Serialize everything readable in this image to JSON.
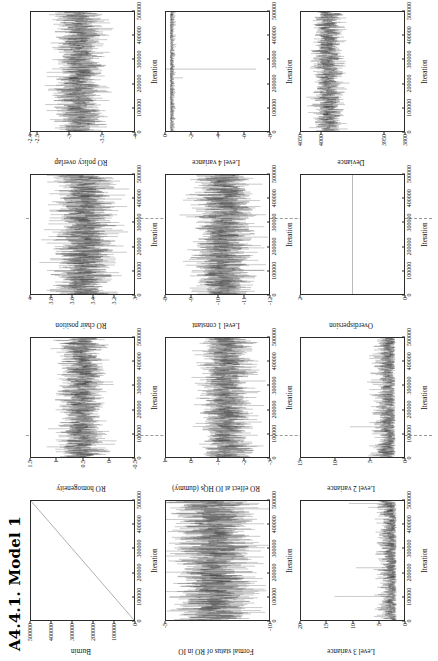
{
  "page": {
    "title": "A4.4.1. Model 1",
    "orientation": "landscape-rotated-90ccw",
    "shared_xlabel": "Iteration",
    "axis_color": "#2b2b2b",
    "trace_color": "#000000",
    "divider_color": "#9a9a9a"
  },
  "chart_data": [
    {
      "id": "burnin",
      "type": "line",
      "title": "",
      "ylabel": "Burnin",
      "xlabel": "Iteration",
      "xlim": [
        0,
        500000
      ],
      "ylim": [
        0,
        500000
      ],
      "xticks": [
        0,
        100000,
        200000,
        300000,
        400000,
        500000
      ],
      "xticklabels": [
        "0",
        "100000",
        "200000",
        "300000",
        "400000",
        "500000"
      ],
      "yticks": [
        0,
        100000,
        200000,
        300000,
        400000,
        500000
      ],
      "yticklabels": [
        "0",
        "100000",
        "200000",
        "300000",
        "400000",
        "500000"
      ],
      "grid": false,
      "note": "monotone increasing straight diagonal line from (0,0) to (500000,500000)",
      "series": [
        {
          "name": "burnin",
          "x": [
            0,
            500000
          ],
          "values": [
            0,
            500000
          ]
        }
      ]
    },
    {
      "id": "ro-homogeneity",
      "type": "line",
      "ylabel": "RO homogeneity",
      "xlabel": "Iteration",
      "xlim": [
        0,
        500000
      ],
      "ylim": [
        -0.5,
        1.5
      ],
      "xticks": [
        0,
        100000,
        200000,
        300000,
        400000,
        500000
      ],
      "xticklabels": [
        "0",
        "100000",
        "200000",
        "300000",
        "400000",
        "500000"
      ],
      "yticks": [
        -0.5,
        0,
        0.5,
        1,
        1.5
      ],
      "yticklabels": [
        "-0.5",
        "0",
        "0.5",
        "1",
        "1.5"
      ],
      "band": [
        0.08,
        0.95
      ],
      "mean": 0.5,
      "grid": false
    },
    {
      "id": "ro-chair-position",
      "type": "line",
      "ylabel": "RO chair position",
      "xlabel": "Iteration",
      "xlim": [
        0,
        500000
      ],
      "ylim": [
        3.0,
        4.0
      ],
      "xticks": [
        0,
        100000,
        200000,
        300000,
        400000,
        500000
      ],
      "xticklabels": [
        "0",
        "100000",
        "200000",
        "300000",
        "400000",
        "500000"
      ],
      "yticks": [
        3.0,
        3.2,
        3.4,
        3.6,
        3.8,
        4.0
      ],
      "yticklabels": [
        "3",
        "3.2",
        "3.4",
        "3.6",
        "3.8",
        "4"
      ],
      "band": [
        3.18,
        3.78
      ],
      "mean": 3.47,
      "grid": false
    },
    {
      "id": "ro-policy-overlap",
      "type": "line",
      "ylabel": "RO policy overlap",
      "xlabel": "Iteration",
      "xlim": [
        0,
        500000
      ],
      "ylim": [
        -4.0,
        -2.4
      ],
      "xticks": [
        0,
        100000,
        200000,
        300000,
        400000,
        500000
      ],
      "xticklabels": [
        "0",
        "100000",
        "200000",
        "300000",
        "400000",
        "500000"
      ],
      "yticks": [
        -4.0,
        -3.5,
        -3.0,
        -2.5,
        -2.4
      ],
      "yticklabels": [
        "-4",
        "-3.5",
        "-3",
        "-2.5",
        "-2.4"
      ],
      "band": [
        -3.52,
        -2.78
      ],
      "mean": -3.14,
      "grid": false
    },
    {
      "id": "formal-status-of-ro-in-io",
      "type": "line",
      "ylabel": "Formal status of RO in IO",
      "xlabel": "Iteration",
      "xlim": [
        0,
        500000
      ],
      "ylim": [
        -10,
        -5
      ],
      "xticks": [
        0,
        100000,
        200000,
        300000,
        400000,
        500000
      ],
      "xticklabels": [
        "0",
        "100000",
        "200000",
        "300000",
        "400000",
        "500000"
      ],
      "yticks": [
        -10,
        -5,
        0,
        5
      ],
      "yticklabels": [
        "-10",
        "-5",
        "0",
        "5"
      ],
      "band": [
        -9.3,
        -5.4
      ],
      "mean": -7.3,
      "grid": false
    },
    {
      "id": "ro-effect-at-io-hqs-dummy",
      "type": "line",
      "ylabel": "RO effect at IO HQs (dummy)",
      "xlabel": "Iteration",
      "xlim": [
        0,
        500000
      ],
      "ylim": [
        -3,
        1
      ],
      "xticks": [
        0,
        100000,
        200000,
        300000,
        400000,
        500000
      ],
      "xticklabels": [
        "0",
        "100000",
        "200000",
        "300000",
        "400000",
        "500000"
      ],
      "yticks": [
        -3,
        -2,
        -1,
        0,
        1
      ],
      "yticklabels": [
        "-3",
        "-2",
        "-1",
        "0",
        "1"
      ],
      "band": [
        -2.35,
        -0.35
      ],
      "mean": -1.3,
      "grid": false
    },
    {
      "id": "level-1-constant",
      "type": "line",
      "ylabel": "Level 1 constant",
      "xlabel": "Iteration",
      "xlim": [
        0,
        500000
      ],
      "ylim": [
        -12,
        -8
      ],
      "xticks": [
        0,
        100000,
        200000,
        300000,
        400000,
        500000
      ],
      "xticklabels": [
        "0",
        "100000",
        "200000",
        "300000",
        "400000",
        "500000"
      ],
      "yticks": [
        -12,
        -11,
        -10,
        -9,
        -8
      ],
      "yticklabels": [
        "-12",
        "-11",
        "-10",
        "-9",
        "-8"
      ],
      "band": [
        -11.4,
        -9.1
      ],
      "mean": -10.2,
      "grid": false
    },
    {
      "id": "level-4-variance",
      "type": "line",
      "ylabel": "Level 4 variance",
      "xlabel": "Iteration",
      "xlim": [
        0,
        500000
      ],
      "ylim": [
        -8,
        0
      ],
      "xticks": [
        0,
        100000,
        200000,
        300000,
        400000,
        500000
      ],
      "xticklabels": [
        "0",
        "100000",
        "200000",
        "300000",
        "400000",
        "500000"
      ],
      "yticks": [
        -8,
        -6,
        -4,
        -2,
        0
      ],
      "yticklabels": [
        "-8",
        "-6",
        "-4",
        "-2",
        "0"
      ],
      "band": [
        -0.6,
        0
      ],
      "mean": -0.2,
      "note": "mostly flat near 0 with occasional large negative spikes; one spike reaching about -7 near iteration 260000",
      "grid": false
    },
    {
      "id": "level-3-variance",
      "type": "line",
      "ylabel": "Level 3 variance",
      "xlabel": "Iteration",
      "xlim": [
        0,
        500000
      ],
      "ylim": [
        0,
        20
      ],
      "xticks": [
        0,
        100000,
        200000,
        300000,
        400000,
        500000
      ],
      "xticklabels": [
        "0",
        "100000",
        "200000",
        "300000",
        "400000",
        "500000"
      ],
      "yticks": [
        0,
        5,
        10,
        15,
        20
      ],
      "yticklabels": [
        "0",
        "5",
        "10",
        "15",
        "20"
      ],
      "band": [
        0.4,
        5.0
      ],
      "mean": 2.2,
      "note": "right-skewed with occasional spikes up to about 17",
      "grid": false
    },
    {
      "id": "level-2-variance",
      "type": "line",
      "ylabel": "Level 2 variance",
      "xlabel": "Iteration",
      "xlim": [
        0,
        500000
      ],
      "ylim": [
        0,
        15
      ],
      "xticks": [
        0,
        100000,
        200000,
        300000,
        400000,
        500000
      ],
      "xticklabels": [
        "0",
        "100000",
        "200000",
        "300000",
        "400000",
        "500000"
      ],
      "yticks": [
        0,
        5,
        10,
        15
      ],
      "yticklabels": [
        "0",
        "5",
        "10",
        "15"
      ],
      "band": [
        0.3,
        4.5
      ],
      "mean": 1.9,
      "note": "right-skewed with occasional spikes up to about 13",
      "grid": false
    },
    {
      "id": "overdispersion",
      "type": "line",
      "ylabel": "Overdispersion",
      "xlabel": "Iteration",
      "xlim": [
        0,
        500000
      ],
      "ylim": [
        0,
        2
      ],
      "xticks": [
        0,
        100000,
        200000,
        300000,
        400000,
        500000
      ],
      "xticklabels": [
        "0",
        "100000",
        "200000",
        "300000",
        "400000",
        "500000"
      ],
      "yticks": [
        0,
        2
      ],
      "yticklabels": [
        "0",
        "2"
      ],
      "band": [
        1.0,
        1.0
      ],
      "mean": 1.0,
      "note": "perfectly flat constant line at 1 (fixed, not estimated)",
      "grid": false
    },
    {
      "id": "deviance",
      "type": "line",
      "ylabel": "Deviance",
      "xlabel": "Iteration",
      "xlim": [
        0,
        500000
      ],
      "ylim": [
        3800,
        4050
      ],
      "xticks": [
        0,
        100000,
        200000,
        300000,
        400000,
        500000
      ],
      "xticklabels": [
        "0",
        "100000",
        "200000",
        "300000",
        "400000",
        "500000"
      ],
      "yticks": [
        3800,
        3850,
        4000,
        4050
      ],
      "yticklabels": [
        "3800",
        "3950",
        "4000",
        "4050"
      ],
      "band": [
        3948,
        4020
      ],
      "mean": 3985,
      "grid": false
    }
  ]
}
